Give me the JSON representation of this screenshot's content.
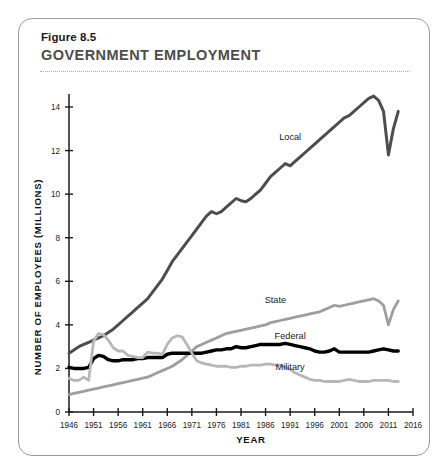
{
  "figure": {
    "number": "Figure 8.5",
    "title": "GOVERNMENT EMPLOYMENT"
  },
  "chart_data": {
    "type": "line",
    "title": "GOVERNMENT EMPLOYMENT",
    "xlabel": "YEAR",
    "ylabel": "NUMBER OF EMPLOYEES (MILLIONS)",
    "xlim": [
      1946,
      2016
    ],
    "ylim": [
      0,
      14
    ],
    "xticks": [
      1946,
      1951,
      1956,
      1961,
      1966,
      1971,
      1976,
      1981,
      1986,
      1991,
      1996,
      2001,
      2006,
      2011,
      2016
    ],
    "yticks": [
      0,
      2,
      4,
      6,
      8,
      10,
      12,
      14
    ],
    "grid": false,
    "legend_position": "inline-labels",
    "colors": {
      "local": "#4d4d4d",
      "state": "#9e9e9e",
      "federal": "#000000",
      "military": "#b7b7b7"
    },
    "series": [
      {
        "name": "Local",
        "color": "#4d4d4d",
        "label_year": 1991,
        "label_value": 12.5,
        "x": [
          1946,
          1947,
          1948,
          1949,
          1950,
          1951,
          1952,
          1953,
          1954,
          1955,
          1956,
          1957,
          1958,
          1959,
          1960,
          1961,
          1962,
          1963,
          1964,
          1965,
          1966,
          1967,
          1968,
          1969,
          1970,
          1971,
          1972,
          1973,
          1974,
          1975,
          1976,
          1977,
          1978,
          1979,
          1980,
          1981,
          1982,
          1983,
          1984,
          1985,
          1986,
          1987,
          1988,
          1989,
          1990,
          1991,
          1992,
          1993,
          1994,
          1995,
          1996,
          1997,
          1998,
          1999,
          2000,
          2001,
          2002,
          2003,
          2004,
          2005,
          2006,
          2007,
          2008,
          2009,
          2010,
          2011,
          2012,
          2013
        ],
        "y": [
          2.7,
          2.85,
          3.0,
          3.1,
          3.2,
          3.3,
          3.4,
          3.5,
          3.65,
          3.8,
          4.0,
          4.2,
          4.4,
          4.6,
          4.8,
          5.0,
          5.2,
          5.5,
          5.8,
          6.1,
          6.5,
          6.9,
          7.2,
          7.5,
          7.8,
          8.1,
          8.4,
          8.7,
          9.0,
          9.2,
          9.1,
          9.2,
          9.4,
          9.6,
          9.8,
          9.7,
          9.65,
          9.8,
          10.0,
          10.2,
          10.5,
          10.8,
          11.0,
          11.2,
          11.4,
          11.3,
          11.5,
          11.7,
          11.9,
          12.1,
          12.3,
          12.5,
          12.7,
          12.9,
          13.1,
          13.3,
          13.5,
          13.6,
          13.8,
          14.0,
          14.2,
          14.4,
          14.5,
          14.3,
          13.8,
          11.8,
          13.0,
          13.8
        ]
      },
      {
        "name": "State",
        "color": "#9e9e9e",
        "label_year": 1988,
        "label_value": 5.0,
        "x": [
          1946,
          1947,
          1948,
          1949,
          1950,
          1951,
          1952,
          1953,
          1954,
          1955,
          1956,
          1957,
          1958,
          1959,
          1960,
          1961,
          1962,
          1963,
          1964,
          1965,
          1966,
          1967,
          1968,
          1969,
          1970,
          1971,
          1972,
          1973,
          1974,
          1975,
          1976,
          1977,
          1978,
          1979,
          1980,
          1981,
          1982,
          1983,
          1984,
          1985,
          1986,
          1987,
          1988,
          1989,
          1990,
          1991,
          1992,
          1993,
          1994,
          1995,
          1996,
          1997,
          1998,
          1999,
          2000,
          2001,
          2002,
          2003,
          2004,
          2005,
          2006,
          2007,
          2008,
          2009,
          2010,
          2011,
          2012,
          2013
        ],
        "y": [
          0.8,
          0.85,
          0.9,
          0.95,
          1.0,
          1.05,
          1.1,
          1.15,
          1.2,
          1.25,
          1.3,
          1.35,
          1.4,
          1.45,
          1.5,
          1.55,
          1.6,
          1.7,
          1.8,
          1.9,
          2.0,
          2.1,
          2.25,
          2.4,
          2.6,
          2.8,
          3.0,
          3.1,
          3.2,
          3.3,
          3.4,
          3.5,
          3.6,
          3.65,
          3.7,
          3.75,
          3.8,
          3.85,
          3.9,
          3.95,
          4.0,
          4.1,
          4.15,
          4.2,
          4.25,
          4.3,
          4.35,
          4.4,
          4.45,
          4.5,
          4.55,
          4.6,
          4.7,
          4.8,
          4.9,
          4.85,
          4.9,
          4.95,
          5.0,
          5.05,
          5.1,
          5.15,
          5.2,
          5.1,
          4.9,
          4.0,
          4.7,
          5.1
        ]
      },
      {
        "name": "Federal",
        "color": "#000000",
        "label_year": 1991,
        "label_value": 3.35,
        "x": [
          1946,
          1947,
          1948,
          1949,
          1950,
          1951,
          1952,
          1953,
          1954,
          1955,
          1956,
          1957,
          1958,
          1959,
          1960,
          1961,
          1962,
          1963,
          1964,
          1965,
          1966,
          1967,
          1968,
          1969,
          1970,
          1971,
          1972,
          1973,
          1974,
          1975,
          1976,
          1977,
          1978,
          1979,
          1980,
          1981,
          1982,
          1983,
          1984,
          1985,
          1986,
          1987,
          1988,
          1989,
          1990,
          1991,
          1992,
          1993,
          1994,
          1995,
          1996,
          1997,
          1998,
          1999,
          2000,
          2001,
          2002,
          2003,
          2004,
          2005,
          2006,
          2007,
          2008,
          2009,
          2010,
          2011,
          2012,
          2013
        ],
        "y": [
          2.05,
          2.0,
          2.0,
          2.0,
          2.05,
          2.45,
          2.6,
          2.55,
          2.4,
          2.35,
          2.35,
          2.4,
          2.4,
          2.4,
          2.45,
          2.45,
          2.5,
          2.5,
          2.5,
          2.5,
          2.65,
          2.7,
          2.7,
          2.7,
          2.7,
          2.7,
          2.7,
          2.7,
          2.75,
          2.8,
          2.85,
          2.85,
          2.9,
          2.9,
          3.0,
          2.95,
          2.95,
          3.0,
          3.05,
          3.1,
          3.1,
          3.1,
          3.1,
          3.1,
          3.15,
          3.1,
          3.05,
          3.0,
          2.95,
          2.9,
          2.8,
          2.75,
          2.75,
          2.8,
          2.9,
          2.75,
          2.75,
          2.75,
          2.75,
          2.75,
          2.75,
          2.75,
          2.8,
          2.85,
          2.9,
          2.85,
          2.8,
          2.8
        ]
      },
      {
        "name": "Military",
        "color": "#b7b7b7",
        "label_year": 1991,
        "label_value": 1.95,
        "x": [
          1946,
          1947,
          1948,
          1949,
          1950,
          1951,
          1952,
          1953,
          1954,
          1955,
          1956,
          1957,
          1958,
          1959,
          1960,
          1961,
          1962,
          1963,
          1964,
          1965,
          1966,
          1967,
          1968,
          1969,
          1970,
          1971,
          1972,
          1973,
          1974,
          1975,
          1976,
          1977,
          1978,
          1979,
          1980,
          1981,
          1982,
          1983,
          1984,
          1985,
          1986,
          1987,
          1988,
          1989,
          1990,
          1991,
          1992,
          1993,
          1994,
          1995,
          1996,
          1997,
          1998,
          1999,
          2000,
          2001,
          2002,
          2003,
          2004,
          2005,
          2006,
          2007,
          2008,
          2009,
          2010,
          2011,
          2012,
          2013
        ],
        "y": [
          1.55,
          1.45,
          1.45,
          1.6,
          1.45,
          3.25,
          3.6,
          3.55,
          3.3,
          2.95,
          2.8,
          2.8,
          2.6,
          2.55,
          2.5,
          2.5,
          2.75,
          2.7,
          2.7,
          2.65,
          3.1,
          3.4,
          3.5,
          3.45,
          3.1,
          2.7,
          2.35,
          2.25,
          2.2,
          2.15,
          2.1,
          2.1,
          2.1,
          2.05,
          2.05,
          2.1,
          2.1,
          2.15,
          2.15,
          2.15,
          2.2,
          2.2,
          2.15,
          2.15,
          2.05,
          1.95,
          1.8,
          1.7,
          1.6,
          1.5,
          1.45,
          1.45,
          1.4,
          1.4,
          1.4,
          1.4,
          1.45,
          1.5,
          1.45,
          1.4,
          1.4,
          1.4,
          1.45,
          1.45,
          1.45,
          1.45,
          1.4,
          1.4
        ]
      }
    ]
  }
}
